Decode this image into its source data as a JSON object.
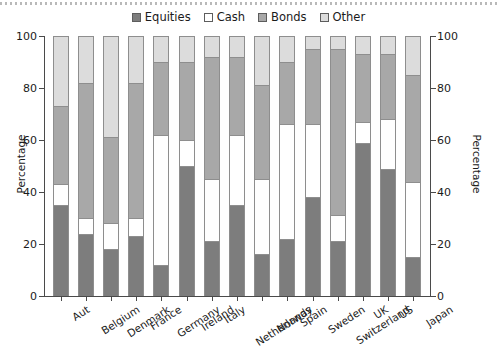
{
  "chart_data": {
    "type": "bar",
    "subtype": "stacked-bar-100",
    "title": "",
    "xlabel": "",
    "ylabel": "Percentage",
    "ylabel_right": "Percentage",
    "ylim": [
      0,
      100
    ],
    "yticks": [
      0,
      20,
      40,
      60,
      80,
      100
    ],
    "grid": false,
    "legend_position": "top-center",
    "categories": [
      "Aut",
      "Belgium",
      "Denmark",
      "France",
      "Germany",
      "Ireland",
      "Italy",
      "Netherlands",
      "Norway",
      "Spain",
      "Sweden",
      "Switzerland",
      "UK",
      "US",
      "Japan"
    ],
    "series": [
      {
        "name": "Equities",
        "color": "#7d7d7d",
        "values": [
          35,
          24,
          18,
          23,
          12,
          50,
          21,
          35,
          16,
          22,
          38,
          21,
          59,
          49,
          15
        ]
      },
      {
        "name": "Cash",
        "color": "#ffffff",
        "values": [
          8,
          6,
          10,
          7,
          50,
          10,
          24,
          27,
          29,
          44,
          28,
          10,
          8,
          19,
          29
        ]
      },
      {
        "name": "Bonds",
        "color": "#a8a8a8",
        "values": [
          30,
          52,
          33,
          52,
          28,
          30,
          47,
          30,
          36,
          24,
          29,
          64,
          26,
          25,
          41
        ]
      },
      {
        "name": "Other",
        "color": "#dcdcdc",
        "values": [
          27,
          18,
          39,
          18,
          10,
          10,
          8,
          8,
          19,
          10,
          5,
          5,
          7,
          7,
          15
        ]
      }
    ]
  },
  "legend": {
    "items": [
      {
        "label": "Equities",
        "color": "#7d7d7d"
      },
      {
        "label": "Cash",
        "color": "#ffffff"
      },
      {
        "label": "Bonds",
        "color": "#a8a8a8"
      },
      {
        "label": "Other",
        "color": "#dcdcdc"
      }
    ]
  },
  "axes": {
    "left_title": "Percentage",
    "right_title": "Percentage",
    "ticks": [
      "100",
      "80",
      "60",
      "40",
      "20",
      "0"
    ]
  }
}
